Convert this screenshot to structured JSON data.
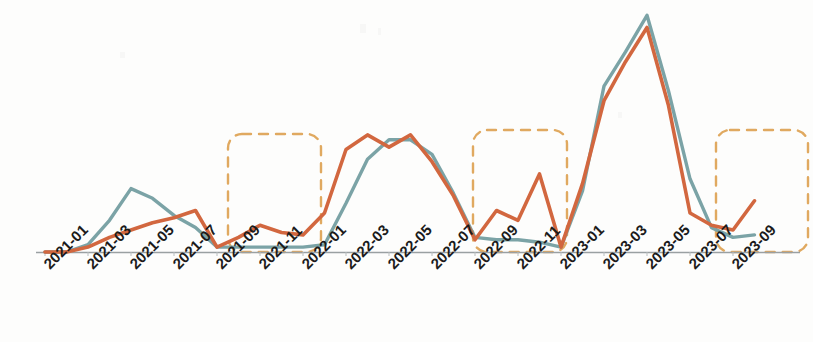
{
  "chart_data": {
    "type": "line",
    "title": "",
    "subtitle": "",
    "xlabel": "",
    "ylabel": "",
    "grid": false,
    "legend_position": "none",
    "axis": {
      "baseline_visible": true,
      "y_axis_visible": false,
      "x_tick_rotation": -45,
      "xlim": [
        "2021-01",
        "2023-10"
      ],
      "ylim": [
        0,
        100
      ]
    },
    "x": [
      "2021-01",
      "2021-02",
      "2021-03",
      "2021-04",
      "2021-05",
      "2021-06",
      "2021-07",
      "2021-08",
      "2021-09",
      "2021-10",
      "2021-11",
      "2021-12",
      "2022-01",
      "2022-02",
      "2022-03",
      "2022-04",
      "2022-05",
      "2022-06",
      "2022-07",
      "2022-08",
      "2022-09",
      "2022-10",
      "2022-11",
      "2022-12",
      "2023-01",
      "2023-02",
      "2023-03",
      "2023-04",
      "2023-05",
      "2023-06",
      "2023-07",
      "2023-08",
      "2023-09",
      "2023-10"
    ],
    "tick_labels": [
      "2021-01",
      "2021-03",
      "2021-05",
      "2021-07",
      "2021-09",
      "2021-11",
      "2022-01",
      "2022-03",
      "2022-05",
      "2022-07",
      "2022-09",
      "2022-11",
      "2023-01",
      "2023-03",
      "2023-05",
      "2023-07",
      "2023-09"
    ],
    "series": [
      {
        "name": "series-teal",
        "color": "#7ba3a6",
        "values": [
          0,
          0,
          3,
          13,
          26,
          22,
          15,
          10,
          2,
          2,
          2,
          2,
          2,
          3,
          20,
          38,
          46,
          46,
          40,
          24,
          6,
          5,
          5,
          4,
          2,
          25,
          68,
          82,
          97,
          66,
          30,
          10,
          6,
          7
        ]
      },
      {
        "name": "series-orange",
        "color": "#d2673f",
        "values": [
          0,
          0,
          2,
          6,
          9,
          12,
          14,
          17,
          2,
          6,
          11,
          8,
          7,
          16,
          42,
          48,
          43,
          48,
          37,
          23,
          5,
          17,
          13,
          32,
          2,
          28,
          62,
          78,
          92,
          60,
          16,
          11,
          9,
          21
        ]
      }
    ],
    "annotations": [
      {
        "name": "highlight-box-1",
        "kind": "dashed-rounded-rect",
        "color": "#e0a960",
        "x_range": [
          "2021-09",
          "2022-01"
        ]
      },
      {
        "name": "highlight-box-2",
        "kind": "dashed-rounded-rect",
        "color": "#e0a960",
        "x_range": [
          "2022-09",
          "2023-01"
        ]
      },
      {
        "name": "highlight-box-3",
        "kind": "dashed-rounded-rect",
        "color": "#e0a960",
        "x_range": [
          "2023-08",
          "2023-10"
        ]
      }
    ]
  },
  "colors": {
    "series_teal": "#7ba3a6",
    "series_orange": "#d2673f",
    "highlight_dashed": "#e0a960",
    "axis_line": "#9aa0a2",
    "tick_text": "#1b1b1b",
    "background": "#fdfdfc"
  }
}
